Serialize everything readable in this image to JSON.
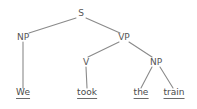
{
  "diagram": {
    "kind": "syntax-tree",
    "sentence": "We took the train",
    "background_color": "#ffffff",
    "line_color": "#8a8a8a",
    "label_color": "#555555",
    "leaf_color": "#4a4a4a"
  },
  "nodes": {
    "s": {
      "label": "S",
      "x": 81,
      "y": 13
    },
    "np_subject": {
      "label": "NP",
      "x": 23,
      "y": 37
    },
    "vp": {
      "label": "VP",
      "x": 124,
      "y": 37
    },
    "v": {
      "label": "V",
      "x": 86,
      "y": 62
    },
    "np_object": {
      "label": "NP",
      "x": 156,
      "y": 62
    }
  },
  "leaves": {
    "we": {
      "label": "We",
      "x": 23,
      "y": 93
    },
    "took": {
      "label": "took",
      "x": 87,
      "y": 93
    },
    "the": {
      "label": "the",
      "x": 141,
      "y": 93
    },
    "train": {
      "label": "train",
      "x": 174,
      "y": 93
    }
  },
  "edges": [
    {
      "name": "s-to-np-subject",
      "from": "S",
      "to": "NP"
    },
    {
      "name": "s-to-vp",
      "from": "S",
      "to": "VP"
    },
    {
      "name": "np-subject-to-we",
      "from": "NP",
      "to": "We"
    },
    {
      "name": "vp-to-v",
      "from": "VP",
      "to": "V"
    },
    {
      "name": "vp-to-np-object",
      "from": "VP",
      "to": "NP"
    },
    {
      "name": "v-to-took",
      "from": "V",
      "to": "took"
    },
    {
      "name": "np-object-to-the",
      "from": "NP",
      "to": "the"
    },
    {
      "name": "np-object-to-train",
      "from": "NP",
      "to": "train"
    }
  ]
}
